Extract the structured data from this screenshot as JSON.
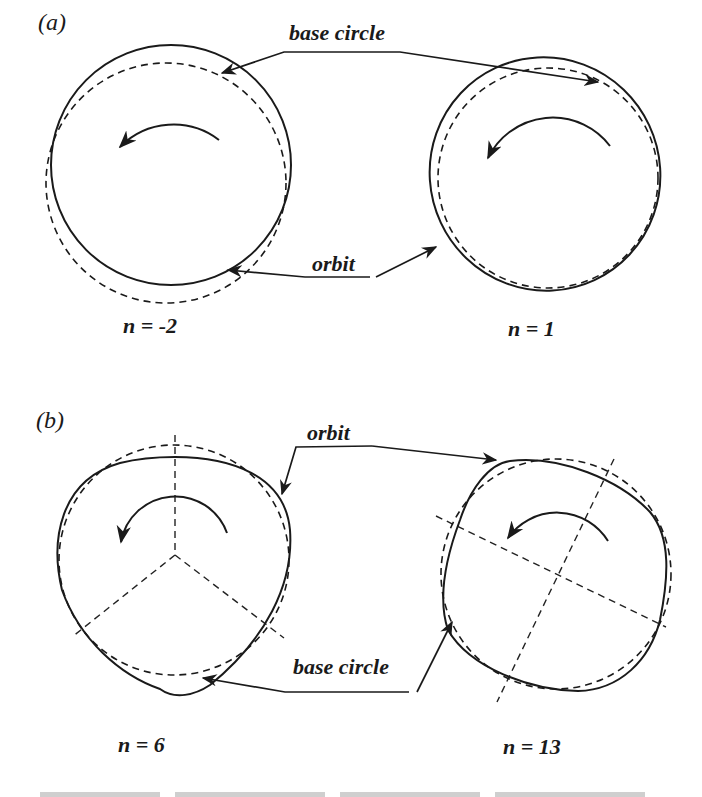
{
  "figure": {
    "panels": [
      {
        "id": "a",
        "label": "(a)",
        "callouts": {
          "top": "base circle",
          "bottom": "orbit"
        },
        "shapes": [
          {
            "n_label": "n = -2",
            "orbit": "circle",
            "rotation": "counterclockwise"
          },
          {
            "n_label": "n = 1",
            "orbit": "tilted ellipse",
            "rotation": "counterclockwise"
          }
        ]
      },
      {
        "id": "b",
        "label": "(b)",
        "callouts": {
          "top": "orbit",
          "bottom": "base circle"
        },
        "shapes": [
          {
            "n_label": "n = 6",
            "orbit": "3-fold rounded triangle",
            "symmetry_axes": 3,
            "rotation": "counterclockwise"
          },
          {
            "n_label": "n = 13",
            "orbit": "4-fold rounded square",
            "symmetry_axes": 4,
            "rotation": "counterclockwise"
          }
        ]
      }
    ],
    "legend": {
      "solid_line": "orbit",
      "dashed_line": "base circle"
    },
    "colors": {
      "ink": "#1a1a1a",
      "background": "#ffffff"
    }
  }
}
